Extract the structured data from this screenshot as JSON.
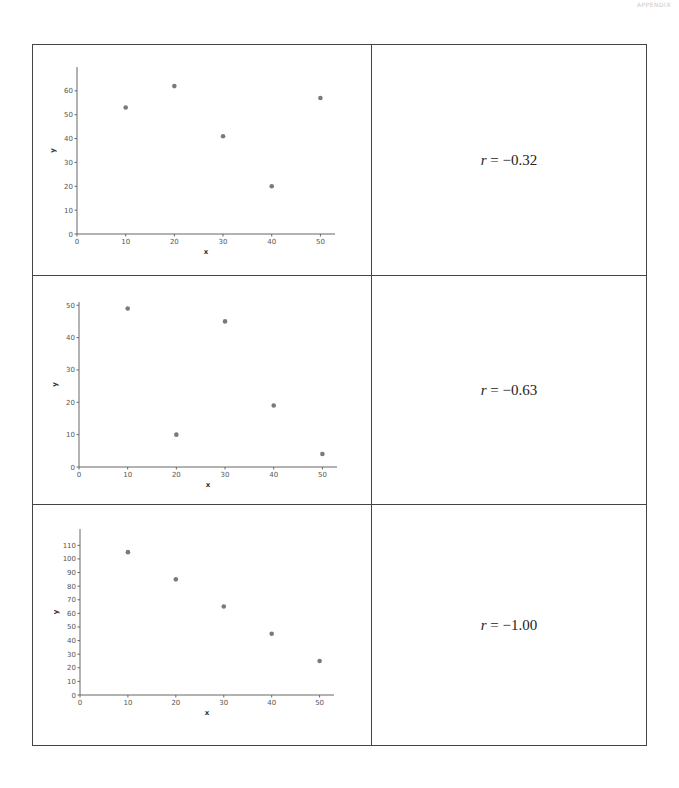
{
  "page": {
    "header_label": "APPENDIX"
  },
  "rows": [
    {
      "r_var": "r",
      "r_text": " = −0.32"
    },
    {
      "r_var": "r",
      "r_text": " = −0.63"
    },
    {
      "r_var": "r",
      "r_text": " = −1.00"
    }
  ],
  "chart_data": [
    {
      "type": "scatter",
      "title": "",
      "xlabel": "x",
      "ylabel": "y",
      "x": [
        10,
        20,
        30,
        40,
        50
      ],
      "y": [
        53,
        62,
        41,
        20,
        57
      ],
      "xlim": [
        0,
        53
      ],
      "ylim": [
        0,
        70
      ],
      "xticks": [
        0,
        10,
        20,
        30,
        40,
        50
      ],
      "yticks": [
        0,
        10,
        20,
        30,
        40,
        50,
        60
      ],
      "grid": false,
      "annotation": "r = −0.32"
    },
    {
      "type": "scatter",
      "title": "",
      "xlabel": "x",
      "ylabel": "y",
      "x": [
        10,
        20,
        30,
        40,
        50
      ],
      "y": [
        49,
        10,
        45,
        19,
        4
      ],
      "xlim": [
        0,
        53
      ],
      "ylim": [
        0,
        51
      ],
      "xticks": [
        0,
        10,
        20,
        30,
        40,
        50
      ],
      "yticks": [
        0,
        10,
        20,
        30,
        40,
        50
      ],
      "grid": false,
      "annotation": "r = −0.63"
    },
    {
      "type": "scatter",
      "title": "",
      "xlabel": "x",
      "ylabel": "y",
      "x": [
        10,
        20,
        30,
        40,
        50
      ],
      "y": [
        105,
        85,
        65,
        45,
        25
      ],
      "xlim": [
        0,
        53
      ],
      "ylim": [
        0,
        122
      ],
      "xticks": [
        0,
        10,
        20,
        30,
        40,
        50
      ],
      "yticks": [
        0,
        10,
        20,
        30,
        40,
        50,
        60,
        70,
        80,
        90,
        100,
        110
      ],
      "grid": false,
      "annotation": "r = −1.00"
    }
  ],
  "style": {
    "marker_color": "#7a7a7a",
    "axis_color": "#666666",
    "border_color": "#444444"
  }
}
